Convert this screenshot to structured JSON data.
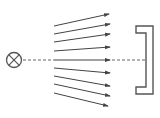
{
  "diagram": {
    "colors": {
      "stroke": "#555555",
      "arrow": "#444444",
      "background": "#ffffff"
    },
    "source": {
      "icon": "lamp-cross-circle-icon",
      "cx": 14,
      "cy": 60,
      "r": 7.5
    },
    "axis": {
      "y": 60,
      "dashed_left": [
        23,
        54
      ],
      "solid": [
        54,
        110
      ],
      "dashed_right": [
        112,
        146
      ]
    },
    "rays_upper": [
      {
        "x1": 54,
        "y1": 26,
        "x2": 109,
        "y2": 14
      },
      {
        "x1": 54,
        "y1": 34,
        "x2": 110,
        "y2": 24
      },
      {
        "x1": 54,
        "y1": 42,
        "x2": 110,
        "y2": 34
      },
      {
        "x1": 54,
        "y1": 51,
        "x2": 110,
        "y2": 47
      }
    ],
    "rays_lower": [
      {
        "x1": 54,
        "y1": 68,
        "x2": 110,
        "y2": 73
      },
      {
        "x1": 54,
        "y1": 76,
        "x2": 110,
        "y2": 86
      },
      {
        "x1": 54,
        "y1": 84,
        "x2": 110,
        "y2": 96
      },
      {
        "x1": 54,
        "y1": 93,
        "x2": 108,
        "y2": 106
      }
    ],
    "screen": {
      "icon": "bracket-screen-icon",
      "points": "136,26 153,26 153,94 136,94 136,87 146,87 146,33 136,33"
    }
  }
}
